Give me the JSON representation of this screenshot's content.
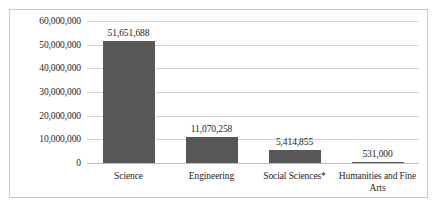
{
  "chart_data": {
    "type": "bar",
    "title": "",
    "xlabel": "",
    "ylabel": "",
    "categories": [
      "Science",
      "Engineering",
      "Social Sciences*",
      "Humanities and Fine Arts"
    ],
    "values": [
      51651688,
      11070258,
      5414855,
      531000
    ],
    "value_labels": [
      "51,651,688",
      "11,070,258",
      "5,414,855",
      "531,000"
    ],
    "ylim": [
      0,
      60000000
    ],
    "ytick_values": [
      60000000,
      50000000,
      40000000,
      30000000,
      20000000,
      10000000,
      0
    ],
    "ytick_labels": [
      "60,000,000",
      "50,000,000",
      "40,000,000",
      "30,000,000",
      "20,000,000",
      "10,000,000",
      "0"
    ],
    "grid": true,
    "legend": "none",
    "bar_color": "#575757",
    "gridline_color": "#d3d3d3",
    "frame_color": "#c8c8c8"
  }
}
